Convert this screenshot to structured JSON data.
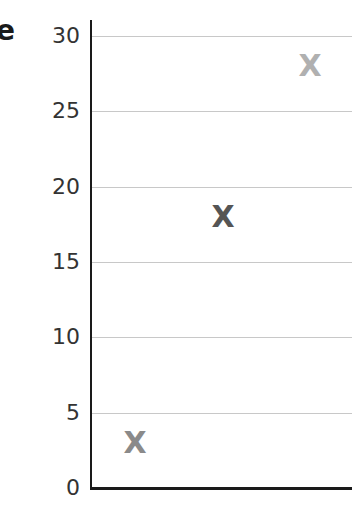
{
  "label_fragment": "e",
  "chart_data": {
    "type": "scatter",
    "title": "",
    "xlabel": "",
    "ylabel": "",
    "ylim": [
      0,
      30
    ],
    "yticks": [
      0,
      5,
      10,
      15,
      20,
      25,
      30
    ],
    "ytick_labels": [
      "0",
      "5",
      "10",
      "15",
      "20",
      "25",
      "30"
    ],
    "grid": true,
    "marker": "X",
    "points": [
      {
        "x": 1,
        "y": 3,
        "color": "#8a8a8a"
      },
      {
        "x": 2,
        "y": 18,
        "color": "#555555"
      },
      {
        "x": 3,
        "y": 28,
        "color": "#b0b0b0"
      }
    ]
  }
}
